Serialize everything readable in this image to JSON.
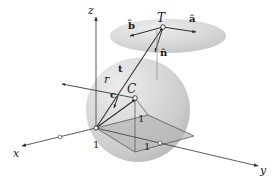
{
  "figure": {
    "type": "geometry-diagram",
    "background_color": "#ffffff",
    "line_color": "#3c3c3c",
    "sphere_fill": "#d2d2d2",
    "disc_fill": "#cfcfcf",
    "base_fill": "#bdbdbd"
  },
  "axes": {
    "x_label": "x",
    "y_label": "y",
    "z_label": "z"
  },
  "points": {
    "center_label": "C",
    "tangent_label": "T"
  },
  "vectors": {
    "a_hat": "â",
    "b_hat": "b̂",
    "n_hat": "n̂",
    "t": "t",
    "c": "c",
    "r": "r"
  },
  "measures": {
    "unit_1": "1",
    "unit_2": "1",
    "unit_3": "1"
  }
}
